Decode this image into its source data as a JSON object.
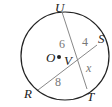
{
  "diagram": {
    "type": "circle-intersecting-chords",
    "center_label": "O",
    "intersection_label": "V",
    "points": {
      "U": "U",
      "S": "S",
      "R": "R",
      "T": "T"
    },
    "segments": {
      "UV": "6",
      "VS": "4",
      "RV": "8",
      "VT": "x"
    },
    "colors": {
      "circle": "#222222",
      "chords": "#888888",
      "labels": "#222222",
      "values": "#777777"
    }
  }
}
